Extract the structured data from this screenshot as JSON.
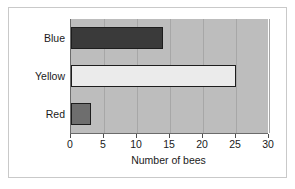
{
  "chart_data": {
    "type": "bar",
    "orientation": "horizontal",
    "title": "",
    "categories": [
      "Blue",
      "Yellow",
      "Red"
    ],
    "values": [
      14,
      25,
      3
    ],
    "bar_colors": [
      "#3a3a3a",
      "#ebebeb",
      "#6e6e6e"
    ],
    "bar_border_color": "#1d1d1d",
    "xlabel": "Number of bees",
    "ylabel": "",
    "xlim": [
      0,
      30
    ],
    "xticks": [
      0,
      5,
      10,
      15,
      20,
      25,
      30
    ],
    "xtick_labels": [
      "0",
      "5",
      "10",
      "15",
      "20",
      "25",
      "30"
    ],
    "grid": true,
    "grid_axis": "x",
    "legend": false,
    "plot_background": "#bdbdbd",
    "page_background": "#ffffff",
    "frame_border_color": "#c9c9c9"
  }
}
